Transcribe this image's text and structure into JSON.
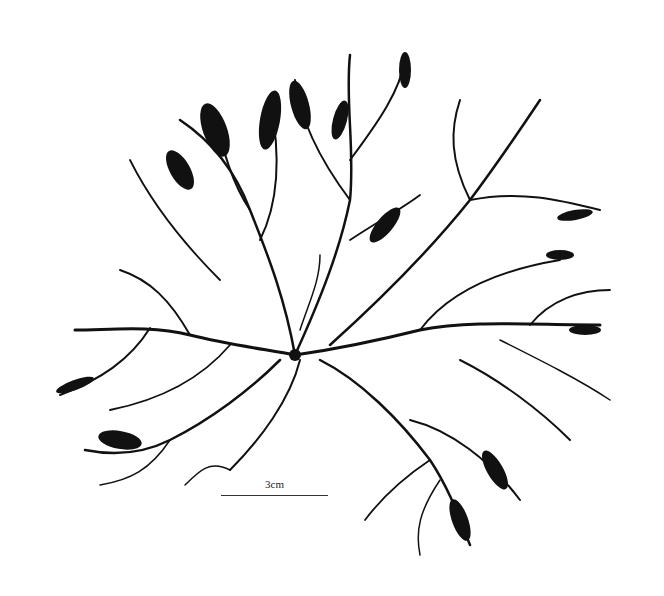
{
  "image": {
    "subject": "pressed red seaweed specimen with dichotomous branching",
    "background_color": "#ffffff",
    "specimen_color": "#111111"
  },
  "scale_bar": {
    "label": "3cm"
  }
}
